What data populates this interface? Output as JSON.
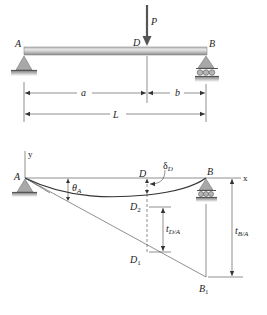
{
  "figure": {
    "colors": {
      "line": "#333333",
      "beam_light": "#d9d9d9",
      "beam_dark": "#9a9a9a",
      "support_fill": "#a8a8a8",
      "ground": "#7a7a7a",
      "label": "#222222"
    },
    "top_diagram": {
      "load_label": "P",
      "point_labels": {
        "A": "A",
        "D": "D",
        "B": "B"
      },
      "dimensions": {
        "a": "a",
        "b": "b",
        "L": "L"
      }
    },
    "bottom_diagram": {
      "axis_labels": {
        "y": "y",
        "x": "x"
      },
      "point_labels": {
        "A": "A",
        "D": "D",
        "B": "B",
        "D1": "D",
        "D1_sub": "1",
        "D2": "D",
        "D2_sub": "2",
        "B1": "B",
        "B1_sub": "1"
      },
      "annotations": {
        "theta": "θ",
        "theta_sub": "A",
        "delta": "δ",
        "delta_sub": "D",
        "t_DA": "t",
        "t_DA_sub": "D/A",
        "t_BA": "t",
        "t_BA_sub": "B/A"
      }
    }
  }
}
